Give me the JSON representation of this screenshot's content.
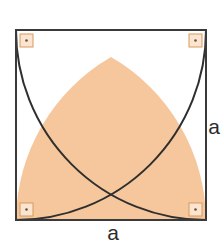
{
  "figure": {
    "title": "Square with two intersecting quarter-circle arcs forming a shaded Gothic arch",
    "shape_name": "gothic-arch-in-square",
    "square": {
      "side_label": "a",
      "x": 16,
      "y": 30,
      "side_px": 190,
      "stroke_color": "#3a3a3a",
      "stroke_width": 2,
      "fill_color": "#ffffff"
    },
    "arcs": {
      "radius_px": 190,
      "stroke_color": "#2f2f2f",
      "stroke_width": 2,
      "left_arc": {
        "center": "bottom-left-corner",
        "from": "top-right-corner",
        "to": "bottom-left-corner"
      },
      "right_arc": {
        "center": "bottom-right-corner",
        "from": "top-left-corner",
        "to": "bottom-right-corner"
      },
      "apex": {
        "x": 111,
        "y": 57
      }
    },
    "shaded_region": {
      "name": "gothic-arch-region",
      "fill_color": "#f6c79c",
      "stroke_color": "#2f2f2f"
    },
    "right_angle_markers": {
      "count": 4,
      "size_px": 13,
      "inset_px": 4,
      "stroke_color": "#d79a5b",
      "fill_color": "#fbe5d0",
      "dot_color": "#6b5338",
      "positions": [
        {
          "name": "top-left",
          "x": 20,
          "y": 34
        },
        {
          "name": "top-right",
          "x": 189,
          "y": 34
        },
        {
          "name": "bottom-left",
          "x": 20,
          "y": 205
        },
        {
          "name": "bottom-right",
          "x": 189,
          "y": 205
        }
      ]
    },
    "labels": {
      "right_side": {
        "text": "a",
        "x": 214,
        "y": 128
      },
      "bottom_side": {
        "text": "a",
        "x": 113,
        "y": 240
      }
    }
  }
}
